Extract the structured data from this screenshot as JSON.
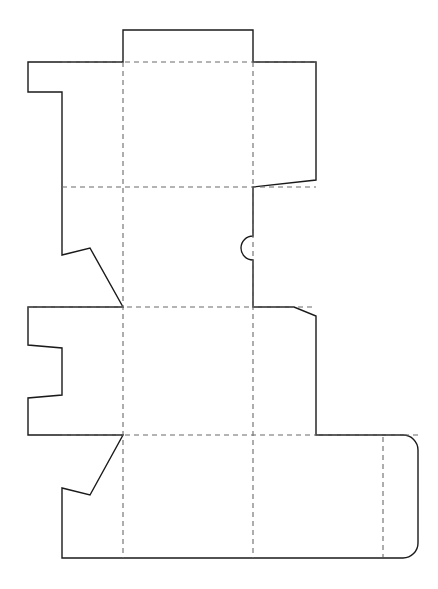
{
  "document": {
    "type": "packaging-dieline",
    "title": "Carton Dieline Template",
    "canvas": {
      "width": 438,
      "height": 589
    },
    "background_color": "#ffffff"
  },
  "styles": {
    "cut_line_color": "#1a1a1a",
    "cut_line_width": 1.4,
    "fold_line_color": "#6b6b6b",
    "fold_line_width": 1.1,
    "fold_dash_pattern": "5 4"
  },
  "geometry": {
    "fold_lines_vertical": [
      {
        "name": "fold-vertical-left",
        "x": 123,
        "y1": 62,
        "y2": 558
      },
      {
        "name": "fold-vertical-right",
        "x": 253,
        "y1": 62,
        "y2": 558
      },
      {
        "name": "fold-vertical-tuck",
        "x": 383,
        "y1": 437,
        "y2": 557
      }
    ],
    "fold_lines_horizontal": [
      {
        "name": "fold-horizontal-top",
        "x1": 62,
        "x2": 316,
        "y": 62
      },
      {
        "name": "fold-horizontal-middle",
        "x1": 62,
        "x2": 316,
        "y": 187
      },
      {
        "name": "fold-horizontal-lower",
        "x1": 28,
        "x2": 316,
        "y": 307
      },
      {
        "name": "fold-horizontal-bottom",
        "x1": 62,
        "x2": 418,
        "y": 435
      }
    ],
    "outline_path": "M 123 62 L 123 30 L 253 30 L 253 62 L 316 62 L 316 180 L 253 187 L 253 236 A 12 12 0 0 0 253 260 L 253 307 L 294 307 L 316 316 L 316 435 L 403 435 A 15 15 0 0 1 418 450 L 418 543 A 15 15 0 0 1 403 558 L 62 558 L 62 488 L 90 495 L 123 435 L 28 435 L 28 398 L 62 395 L 62 348 L 28 345 L 28 307 L 123 307 L 90 248 L 62 255 L 62 187 L 62 92 L 28 92 L 28 62 Z",
    "outline_vertices": [
      {
        "name": "top-flap-left-fold",
        "x": 123,
        "y": 62
      },
      {
        "name": "top-flap-top-left",
        "x": 123,
        "y": 30
      },
      {
        "name": "top-flap-top-right",
        "x": 253,
        "y": 30
      },
      {
        "name": "top-flap-right-fold",
        "x": 253,
        "y": 62
      },
      {
        "name": "right-upper-flap-top-right",
        "x": 316,
        "y": 62
      },
      {
        "name": "right-upper-flap-bottom-right",
        "x": 316,
        "y": 180
      },
      {
        "name": "right-upper-flap-bottom-left",
        "x": 253,
        "y": 187
      },
      {
        "name": "thumb-notch-top",
        "x": 253,
        "y": 236
      },
      {
        "name": "thumb-notch-bottom",
        "x": 253,
        "y": 260
      },
      {
        "name": "middle-right-fold-corner",
        "x": 253,
        "y": 307
      },
      {
        "name": "right-lower-flap-shoulder",
        "x": 294,
        "y": 307
      },
      {
        "name": "right-lower-flap-top-right",
        "x": 316,
        "y": 316
      },
      {
        "name": "right-lower-flap-bottom-right",
        "x": 316,
        "y": 435
      },
      {
        "name": "tuck-panel-top-right-arc-start",
        "x": 403,
        "y": 435
      },
      {
        "name": "tuck-panel-right-top",
        "x": 418,
        "y": 450
      },
      {
        "name": "tuck-panel-right-bottom",
        "x": 418,
        "y": 543
      },
      {
        "name": "tuck-panel-bottom-right-arc-end",
        "x": 403,
        "y": 558
      },
      {
        "name": "bottom-edge-left",
        "x": 62,
        "y": 558
      },
      {
        "name": "lower-glue-flap-left-top",
        "x": 62,
        "y": 488
      },
      {
        "name": "lower-glue-flap-notch-vertex",
        "x": 90,
        "y": 495
      },
      {
        "name": "lower-glue-flap-fold-corner",
        "x": 123,
        "y": 435
      },
      {
        "name": "left-lower-tab-outer-top",
        "x": 28,
        "y": 435
      },
      {
        "name": "left-lower-tab-notch-out-bottom",
        "x": 28,
        "y": 398
      },
      {
        "name": "left-lower-tab-notch-in-bottom",
        "x": 62,
        "y": 395
      },
      {
        "name": "left-lower-tab-notch-in-top",
        "x": 62,
        "y": 348
      },
      {
        "name": "left-lower-tab-notch-out-top",
        "x": 28,
        "y": 345
      },
      {
        "name": "left-lower-tab-outer-bottom",
        "x": 28,
        "y": 307
      },
      {
        "name": "upper-glue-flap-fold-corner",
        "x": 123,
        "y": 307
      },
      {
        "name": "upper-glue-flap-notch-vertex",
        "x": 90,
        "y": 248
      },
      {
        "name": "upper-glue-flap-left-bottom",
        "x": 62,
        "y": 255
      },
      {
        "name": "left-upper-panel-mid",
        "x": 62,
        "y": 187
      },
      {
        "name": "left-upper-tab-inner-bottom",
        "x": 62,
        "y": 92
      },
      {
        "name": "left-upper-tab-outer-bottom",
        "x": 28,
        "y": 92
      },
      {
        "name": "left-upper-tab-outer-top",
        "x": 28,
        "y": 62
      }
    ],
    "thumb_notch": {
      "name": "thumb-notch",
      "center_x": 253,
      "center_y": 248,
      "radius": 12,
      "direction": "left"
    },
    "tuck_panel_corner_radius": 15
  },
  "panels": [
    {
      "name": "top-dust-flap",
      "label": "Top Dust Flap"
    },
    {
      "name": "left-side-upper-panel",
      "label": "Left Side Upper Panel"
    },
    {
      "name": "front-upper-panel",
      "label": "Front Upper Panel"
    },
    {
      "name": "right-upper-flap",
      "label": "Right Upper Flap"
    },
    {
      "name": "left-side-middle-panel",
      "label": "Left Side Middle Panel"
    },
    {
      "name": "front-middle-panel",
      "label": "Front Middle Panel"
    },
    {
      "name": "right-lower-flap",
      "label": "Right Lower Flap"
    },
    {
      "name": "bottom-panel",
      "label": "Bottom Panel"
    },
    {
      "name": "tuck-in-panel",
      "label": "Tuck In Panel"
    },
    {
      "name": "upper-glue-flap",
      "label": "Upper Glue Flap"
    },
    {
      "name": "lower-glue-flap",
      "label": "Lower Glue Flap"
    }
  ]
}
